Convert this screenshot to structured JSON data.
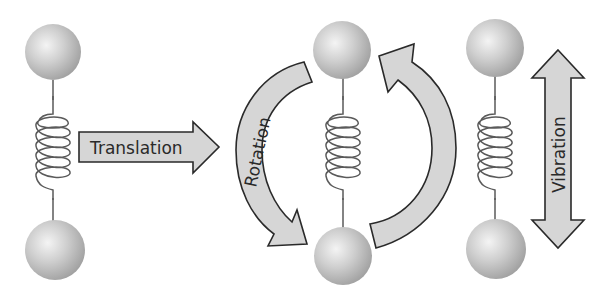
{
  "diagram": {
    "molecules": [
      {
        "id": "left",
        "motion": "translation"
      },
      {
        "id": "middle",
        "motion": "rotation"
      },
      {
        "id": "right",
        "motion": "vibration"
      }
    ],
    "labels": {
      "translation": "Translation",
      "rotation": "Rotation",
      "vibration": "Vibration"
    },
    "icons": {
      "atom": "sphere",
      "bond": "spring",
      "translation_arrow": "right-arrow",
      "rotation_arrows": "curved-arrows",
      "vibration_arrow": "double-vertical-arrow"
    },
    "colors": {
      "background": "#ffffff",
      "arrow_fill": "#d6d6d6",
      "arrow_stroke": "#2a2a2a",
      "sphere_light": "#ececec",
      "sphere_dark": "#9a9a9a",
      "spring": "#5a5a5a",
      "text": "#2a2a2a"
    }
  }
}
